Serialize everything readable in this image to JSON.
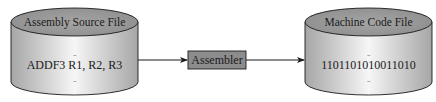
{
  "source_file": {
    "title": "Assembly Source File",
    "content": "ADDF3 R1, R2, R3",
    "ellipsis_top": "..",
    "ellipsis_bottom": ".."
  },
  "processor": {
    "label": "Assembler"
  },
  "target_file": {
    "title": "Machine Code File",
    "content": "1101101010011010",
    "ellipsis_top": "..",
    "ellipsis_bottom": ".."
  },
  "colors": {
    "cylinder_top": "#9a9a9a",
    "cylinder_side_edge": "#a8a8a8",
    "cylinder_side_highlight": "#f4f4f4",
    "processor_fill": "#8c8c8c",
    "line": "#1a1a1a"
  }
}
